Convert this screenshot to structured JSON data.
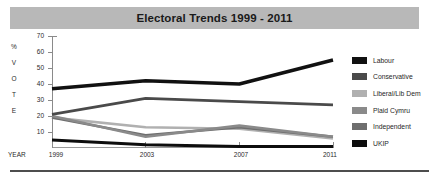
{
  "title": "Electoral Trends 1999 - 2011",
  "axes": {
    "y_axis_title_chars": [
      "%",
      "V",
      "O",
      "T",
      "E"
    ],
    "y_ticks": [
      "70",
      "60",
      "50",
      "40",
      "30",
      "20",
      "10"
    ],
    "x_axis_title": "YEAR",
    "x_ticks": [
      "1999",
      "2003",
      "2007",
      "2011"
    ]
  },
  "legend": {
    "items": [
      {
        "label": "Labour",
        "color": "#111111"
      },
      {
        "label": "Conservative",
        "color": "#4a4a4a"
      },
      {
        "label": "Liberal/Lib Dem",
        "color": "#b0b0b0"
      },
      {
        "label": "Plaid Cymru",
        "color": "#8a8a8a"
      },
      {
        "label": "Independent",
        "color": "#6e6e6e"
      },
      {
        "label": "UKIP",
        "color": "#0d0d0d"
      }
    ]
  },
  "chart_data": {
    "type": "line",
    "title": "Electoral Trends 1999 - 2011",
    "xlabel": "YEAR",
    "ylabel": "% VOTE",
    "categories": [
      "1999",
      "2003",
      "2007",
      "2011"
    ],
    "x": [
      1999,
      2003,
      2007,
      2011
    ],
    "ylim": [
      0,
      70
    ],
    "yticks": [
      10,
      20,
      30,
      40,
      50,
      60,
      70
    ],
    "grid": false,
    "legend_position": "right",
    "series": [
      {
        "name": "Labour",
        "color": "#111111",
        "values": [
          37,
          42,
          40,
          55
        ]
      },
      {
        "name": "Conservative",
        "color": "#4a4a4a",
        "values": [
          21,
          31,
          29,
          27
        ]
      },
      {
        "name": "Liberal/Lib Dem",
        "color": "#b0b0b0",
        "values": [
          19,
          13,
          12,
          6
        ]
      },
      {
        "name": "Plaid Cymru",
        "color": "#8a8a8a",
        "values": [
          20,
          7,
          14,
          7
        ]
      },
      {
        "name": "Independent",
        "color": "#6e6e6e",
        "values": [
          19,
          8,
          13,
          7
        ]
      },
      {
        "name": "UKIP",
        "color": "#0d0d0d",
        "values": [
          5,
          2,
          1,
          1
        ]
      }
    ]
  }
}
